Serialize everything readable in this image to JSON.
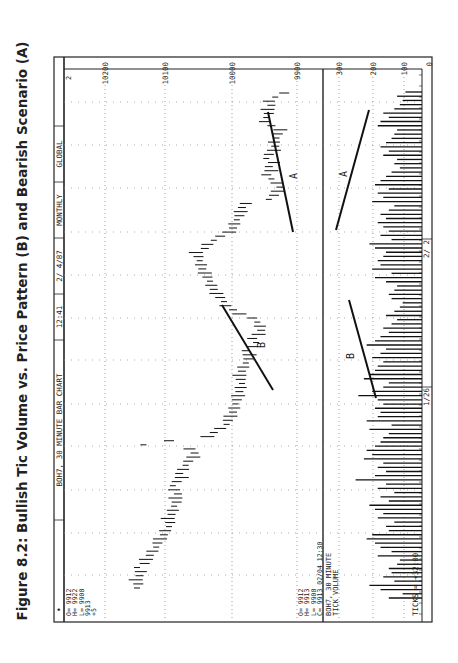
{
  "figure_title": "Figure 8.2: Bullish Tic Volume vs. Price Pattern (B) and Bearish Scenario (A)",
  "header_bar": [
    "BOH7, 30 MINUTE BAR CHART",
    "12:41",
    "2/ 4/87",
    "MONTHLY",
    "GLOBAL",
    ""
  ],
  "top_left_readout": {
    "bullet": "•",
    "lines": [
      "O= 9912",
      "H= 9922",
      "L= 9908",
      "    9913",
      "      +5"
    ]
  },
  "lower_readout": [
    "O= 9912",
    "H= 9913",
    "L= 9908",
    "C= 9913   02/04   12:30"
  ],
  "volume_caption": [
    "BOH7, 30 MINUTE",
    "TICK VOLUME"
  ],
  "ticks_label": "TICKS =   +32:00",
  "corner_marker": "2",
  "date_labels": [
    {
      "label": "2/ 2",
      "pos": 0.27
    },
    {
      "label": "1/26",
      "pos": 0.6
    }
  ],
  "chart_data": {
    "type": "bar",
    "title": "Figure 8.2: Bullish Tic Volume vs. Price Pattern (B) and Bearish Scenario (A)",
    "orientation": "rotated 90 degrees counter-clockwise (time runs bottom-to-top)",
    "price_axis": {
      "label": "Price",
      "ticks": [
        10200,
        10100,
        10000,
        9900
      ],
      "range": [
        10200,
        9850
      ]
    },
    "volume_axis": {
      "label": "Tick Volume",
      "ticks": [
        300,
        200,
        100,
        0
      ],
      "range": [
        330,
        0
      ]
    },
    "grid": true,
    "annotations": [
      {
        "label": "A",
        "pane": "price",
        "desc": "falling highs trendline (bearish scenario)"
      },
      {
        "label": "B",
        "pane": "price",
        "desc": "rising price pattern trendline"
      },
      {
        "label": "A",
        "pane": "volume",
        "desc": "declining volume trendline"
      },
      {
        "label": "B",
        "pane": "volume",
        "desc": "rising volume trendline"
      }
    ],
    "series": [
      {
        "name": "Price (30-min bars, approx. midpoints)",
        "values": [
          10150,
          10148,
          10152,
          10146,
          10144,
          10150,
          10138,
          10136,
          10130,
          10126,
          10120,
          10118,
          10114,
          10108,
          10106,
          10100,
          10098,
          10102,
          10096,
          10094,
          10092,
          10088,
          10090,
          10086,
          10092,
          10094,
          10088,
          10080,
          10084,
          10078,
          10074,
          10070,
          10062,
          10060,
          10068,
          10140,
          10100,
          10040,
          10030,
          10020,
          10010,
          10008,
          10004,
          10000,
          9998,
          9996,
          9994,
          9992,
          9990,
          9988,
          9986,
          9988,
          9990,
          9986,
          9984,
          9980,
          9976,
          9974,
          9980,
          9970,
          9964,
          9970,
          9960,
          9956,
          9958,
          9962,
          9970,
          9990,
          10000,
          10012,
          10014,
          10020,
          10026,
          10030,
          10034,
          10036,
          10040,
          10044,
          10048,
          10050,
          10052,
          10054,
          10058,
          10044,
          10040,
          10030,
          10020,
          10006,
          10000,
          9998,
          9994,
          9990,
          9988,
          9986,
          9980,
          9944,
          9936,
          9930,
          9926,
          9932,
          9940,
          9948,
          9940,
          9944,
          9936,
          9948,
          9944,
          9936,
          9934,
          9936,
          9932,
          9930,
          9926,
          9940,
          9950,
          9948,
          9944,
          9946,
          9940,
          9944,
          9934,
          9920
        ]
      },
      {
        "name": "Tick Volume",
        "values": [
          120,
          70,
          150,
          190,
          100,
          140,
          110,
          120,
          90,
          80,
          160,
          110,
          150,
          170,
          200,
          180,
          120,
          130,
          100,
          160,
          140,
          170,
          190,
          120,
          150,
          100,
          160,
          130,
          240,
          170,
          130,
          160,
          140,
          210,
          180,
          200,
          170,
          150,
          140,
          120,
          190,
          110,
          200,
          160,
          150,
          170,
          140,
          160,
          230,
          180,
          140,
          120,
          210,
          190,
          170,
          160,
          140,
          180,
          150,
          130,
          200,
          170,
          150,
          120,
          140,
          110,
          90,
          130,
          100,
          80,
          70,
          110,
          120,
          100,
          90,
          130,
          170,
          110,
          180,
          150,
          160,
          140,
          130,
          170,
          190,
          110,
          150,
          120,
          140,
          160,
          130,
          150,
          120,
          100,
          180,
          140,
          160,
          120,
          170,
          150,
          130,
          110,
          80,
          100,
          90,
          140,
          120,
          150,
          130,
          110,
          100,
          90,
          160,
          150,
          120,
          140,
          100,
          80,
          70,
          90,
          60
        ]
      }
    ]
  }
}
